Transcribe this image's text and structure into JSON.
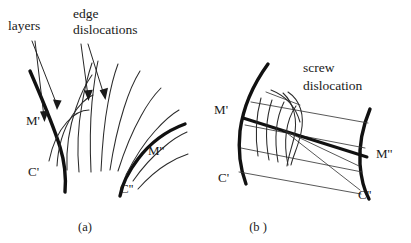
{
  "figure": {
    "background_color": "#ffffff",
    "ink_color": "#111111",
    "width": 411,
    "height": 243
  },
  "panel_a": {
    "caption": "(a)",
    "annotations": [
      {
        "id": "layers",
        "text": "layers",
        "x": 8,
        "y": 30
      },
      {
        "id": "edge-dislocations-line1",
        "text": "edge",
        "x": 73,
        "y": 18
      },
      {
        "id": "edge-dislocations-line2",
        "text": "dislocations",
        "x": 73,
        "y": 34
      }
    ],
    "boundary_labels": [
      {
        "id": "m-prime",
        "text": "M'",
        "x": 26,
        "y": 125
      },
      {
        "id": "c-prime",
        "text": "C'",
        "x": 28,
        "y": 176
      },
      {
        "id": "m-double-prime",
        "text": "M''",
        "x": 148,
        "y": 155
      },
      {
        "id": "c-double-prime",
        "text": "C''",
        "x": 120,
        "y": 193
      }
    ],
    "leader_arrows": 4,
    "fan_curve_count": 11,
    "description": "Fan of curved layer lines between two thick boundary curves C' and C'' with edge dislocations marked by leader arrows"
  },
  "panel_b": {
    "caption": "(b )",
    "annotations": [
      {
        "id": "screw-dislocation-line1",
        "text": "screw",
        "x": 303,
        "y": 72
      },
      {
        "id": "screw-dislocation-line2",
        "text": "dislocation",
        "x": 303,
        "y": 90
      }
    ],
    "boundary_labels": [
      {
        "id": "m-prime",
        "text": "M'",
        "x": 228,
        "y": 114
      },
      {
        "id": "c-prime",
        "text": "C'",
        "x": 229,
        "y": 182
      },
      {
        "id": "m-double-prime",
        "text": "M''",
        "x": 376,
        "y": 153
      },
      {
        "id": "c-double-prime",
        "text": "C''",
        "x": 358,
        "y": 195
      }
    ],
    "band_line_count": 4,
    "cross_curve_count": 6,
    "description": "Two thick arc boundaries C' and C'' joined by a band of straight lines with a thick medial line from M' to M'' and curved screw-dislocation lines crossing the band"
  }
}
